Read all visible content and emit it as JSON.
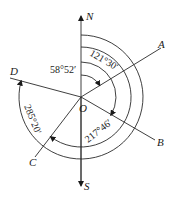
{
  "diagram": {
    "type": "bearing-diagram",
    "center": {
      "label": "O"
    },
    "axes": {
      "north": "N",
      "south": "S"
    },
    "rays": [
      {
        "label": "A",
        "bearing": "58°52′"
      },
      {
        "label": "B",
        "bearing": "121°30′"
      },
      {
        "label": "C",
        "bearing": "217°46′"
      },
      {
        "label": "D",
        "bearing": "285°20′"
      }
    ],
    "angle_labels": {
      "a": "58°52′",
      "b": "121°30′",
      "c": "217°46′",
      "d": "285°20′"
    },
    "colors": {
      "stroke": "#2a2a2a",
      "background": "#ffffff"
    }
  }
}
